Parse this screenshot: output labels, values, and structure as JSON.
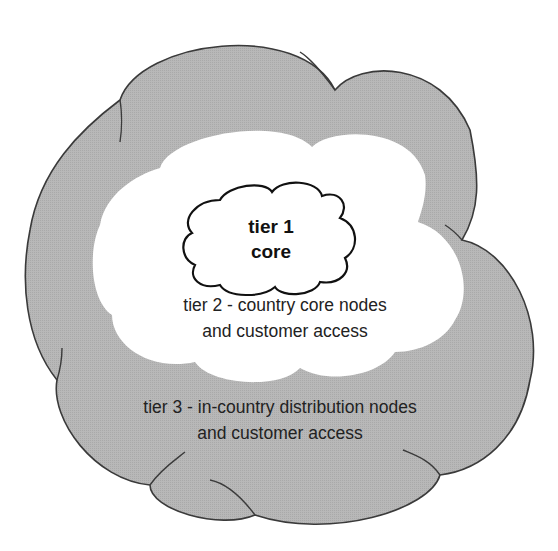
{
  "diagram": {
    "type": "nested-cloud-tiers",
    "colors": {
      "outer_fill": "#b3b3b3",
      "outer_stroke": "#3a3a3a",
      "middle_fill": "#ffffff",
      "inner_fill": "#ffffff",
      "inner_stroke": "#111111",
      "text": "#222222"
    },
    "tiers": [
      {
        "id": "tier1",
        "line1": "tier 1",
        "line2": "core"
      },
      {
        "id": "tier2",
        "line1": "tier 2 - country core nodes",
        "line2": "and customer access"
      },
      {
        "id": "tier3",
        "line1": "tier 3 - in-country distribution nodes",
        "line2": "and customer access"
      }
    ]
  }
}
